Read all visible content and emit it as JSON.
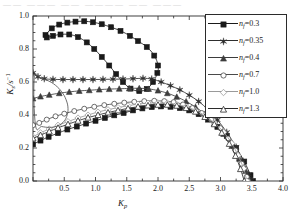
{
  "topstrip": "——  ———  ——  ————  ——  ———",
  "axes": {
    "ylabel_main": "K",
    "ylabel_sub": "s",
    "ylabel_unit": "/s",
    "ylabel_sup": "−1",
    "xlabel_main": "K",
    "xlabel_sub": "p",
    "xticks": [
      "0.5",
      "1.0",
      "1.5",
      "2.0",
      "2.5",
      "3.0",
      "3.5",
      "4.0"
    ],
    "yticks": [
      "0.0",
      "0.2",
      "0.4",
      "0.6",
      "0.8",
      "1.0"
    ]
  },
  "legend": {
    "entries": [
      {
        "label_prefix": "n",
        "label_sub": "f",
        "label_eq": "=0.3",
        "marker": "filled-square",
        "color": "#1a1a1a"
      },
      {
        "label_prefix": "n",
        "label_sub": "f",
        "label_eq": "=0.35",
        "marker": "filled-star",
        "color": "#2e2e2e"
      },
      {
        "label_prefix": "n",
        "label_sub": "f",
        "label_eq": "=0.4",
        "marker": "filled-triangle",
        "color": "#3d3d3d"
      },
      {
        "label_prefix": "n",
        "label_sub": "f",
        "label_eq": "=0.7",
        "marker": "open-circle",
        "color": "#4a4a4a"
      },
      {
        "label_prefix": "n",
        "label_sub": "f",
        "label_eq": "=1.0",
        "marker": "open-diamond",
        "color": "#9a9a9a"
      },
      {
        "label_prefix": "n",
        "label_sub": "f",
        "label_eq": "=1.3",
        "marker": "open-triangle",
        "color": "#2b2b2b"
      }
    ]
  },
  "chart_data": {
    "type": "line",
    "title": "",
    "xlabel": "Kp",
    "ylabel": "Ks / s^-1",
    "xlim": [
      0.0,
      4.0
    ],
    "ylim": [
      0.0,
      1.0
    ],
    "grid": false,
    "legend_position": "top-right",
    "series": [
      {
        "name": "nf=0.3",
        "marker": "filled-square",
        "color": "#1a1a1a",
        "closed_loop": true,
        "points": [
          [
            0.2,
            0.885
          ],
          [
            0.3,
            0.925
          ],
          [
            0.42,
            0.948
          ],
          [
            0.55,
            0.96
          ],
          [
            0.68,
            0.966
          ],
          [
            0.82,
            0.968
          ],
          [
            0.96,
            0.962
          ],
          [
            1.1,
            0.95
          ],
          [
            1.25,
            0.932
          ],
          [
            1.4,
            0.91
          ],
          [
            1.55,
            0.88
          ],
          [
            1.68,
            0.848
          ],
          [
            1.82,
            0.812
          ],
          [
            1.94,
            0.76
          ],
          [
            2.0,
            0.7
          ],
          [
            1.99,
            0.655
          ],
          [
            1.92,
            0.6
          ],
          [
            1.82,
            0.558
          ],
          [
            1.7,
            0.545
          ],
          [
            1.56,
            0.56
          ],
          [
            1.44,
            0.6
          ],
          [
            1.33,
            0.648
          ],
          [
            1.22,
            0.7
          ],
          [
            1.1,
            0.752
          ],
          [
            0.98,
            0.8
          ],
          [
            0.86,
            0.84
          ],
          [
            0.72,
            0.872
          ],
          [
            0.58,
            0.888
          ],
          [
            0.44,
            0.888
          ],
          [
            0.32,
            0.88
          ],
          [
            0.22,
            0.87
          ],
          [
            0.2,
            0.885
          ]
        ]
      },
      {
        "name": "nf=0.3-lower",
        "marker": "filled-square",
        "color": "#1a1a1a",
        "closed_loop": false,
        "points": [
          [
            0.0,
            0.222
          ],
          [
            0.12,
            0.245
          ],
          [
            0.25,
            0.268
          ],
          [
            0.4,
            0.29
          ],
          [
            0.55,
            0.312
          ],
          [
            0.7,
            0.33
          ],
          [
            0.85,
            0.348
          ],
          [
            1.0,
            0.365
          ],
          [
            1.15,
            0.382
          ],
          [
            1.3,
            0.398
          ],
          [
            1.45,
            0.412
          ],
          [
            1.6,
            0.428
          ],
          [
            1.75,
            0.44
          ],
          [
            1.9,
            0.448
          ],
          [
            2.05,
            0.452
          ],
          [
            2.2,
            0.45
          ],
          [
            2.35,
            0.442
          ],
          [
            2.5,
            0.428
          ],
          [
            2.65,
            0.405
          ],
          [
            2.8,
            0.372
          ],
          [
            2.95,
            0.328
          ],
          [
            3.1,
            0.272
          ],
          [
            3.25,
            0.2
          ],
          [
            3.38,
            0.118
          ],
          [
            3.48,
            0.035
          ],
          [
            3.52,
            0.0
          ]
        ]
      },
      {
        "name": "nf=0.35",
        "marker": "filled-star",
        "color": "#2e2e2e",
        "closed_loop": false,
        "points": [
          [
            0.0,
            0.655
          ],
          [
            0.08,
            0.632
          ],
          [
            0.18,
            0.62
          ],
          [
            0.32,
            0.616
          ],
          [
            0.48,
            0.615
          ],
          [
            0.64,
            0.615
          ],
          [
            0.8,
            0.615
          ],
          [
            0.96,
            0.615
          ],
          [
            1.12,
            0.616
          ],
          [
            1.28,
            0.617
          ],
          [
            1.44,
            0.618
          ],
          [
            1.6,
            0.62
          ],
          [
            1.76,
            0.622
          ],
          [
            1.9,
            0.618
          ],
          [
            2.05,
            0.6
          ],
          [
            2.2,
            0.578
          ],
          [
            2.35,
            0.552
          ],
          [
            2.5,
            0.52
          ],
          [
            2.65,
            0.482
          ],
          [
            2.8,
            0.432
          ],
          [
            2.95,
            0.37
          ],
          [
            3.1,
            0.295
          ],
          [
            3.25,
            0.205
          ],
          [
            3.36,
            0.12
          ],
          [
            3.45,
            0.04
          ],
          [
            3.49,
            0.0
          ]
        ]
      },
      {
        "name": "nf=0.4",
        "marker": "filled-triangle",
        "color": "#3d3d3d",
        "closed_loop": false,
        "points": [
          [
            0.0,
            0.5
          ],
          [
            0.12,
            0.512
          ],
          [
            0.26,
            0.522
          ],
          [
            0.42,
            0.532
          ],
          [
            0.58,
            0.54
          ],
          [
            0.74,
            0.546
          ],
          [
            0.9,
            0.55
          ],
          [
            1.06,
            0.554
          ],
          [
            1.22,
            0.557
          ],
          [
            1.38,
            0.559
          ],
          [
            1.54,
            0.561
          ],
          [
            1.7,
            0.562
          ],
          [
            1.85,
            0.558
          ],
          [
            2.0,
            0.548
          ],
          [
            2.15,
            0.532
          ],
          [
            2.3,
            0.51
          ],
          [
            2.45,
            0.482
          ],
          [
            2.6,
            0.448
          ],
          [
            2.75,
            0.405
          ],
          [
            2.9,
            0.35
          ],
          [
            3.05,
            0.285
          ],
          [
            3.18,
            0.212
          ],
          [
            3.3,
            0.135
          ],
          [
            3.4,
            0.06
          ],
          [
            3.46,
            0.0
          ]
        ]
      },
      {
        "name": "nf=0.7",
        "marker": "open-circle",
        "color": "#4a4a4a",
        "closed_loop": false,
        "points": [
          [
            0.0,
            0.338
          ],
          [
            0.1,
            0.352
          ],
          [
            0.22,
            0.372
          ],
          [
            0.36,
            0.392
          ],
          [
            0.5,
            0.408
          ],
          [
            0.66,
            0.424
          ],
          [
            0.82,
            0.438
          ],
          [
            0.98,
            0.45
          ],
          [
            1.14,
            0.46
          ],
          [
            1.3,
            0.468
          ],
          [
            1.46,
            0.475
          ],
          [
            1.62,
            0.48
          ],
          [
            1.78,
            0.484
          ],
          [
            1.94,
            0.486
          ],
          [
            2.1,
            0.484
          ],
          [
            2.25,
            0.478
          ],
          [
            2.4,
            0.464
          ],
          [
            2.55,
            0.442
          ],
          [
            2.7,
            0.412
          ],
          [
            2.85,
            0.372
          ],
          [
            3.0,
            0.32
          ],
          [
            3.12,
            0.258
          ],
          [
            3.24,
            0.185
          ],
          [
            3.34,
            0.105
          ],
          [
            3.42,
            0.025
          ],
          [
            3.44,
            0.0
          ]
        ]
      },
      {
        "name": "nf=1.0",
        "marker": "open-diamond",
        "color": "#9a9a9a",
        "closed_loop": false,
        "points": [
          [
            0.0,
            0.268
          ],
          [
            0.12,
            0.292
          ],
          [
            0.26,
            0.315
          ],
          [
            0.4,
            0.338
          ],
          [
            0.56,
            0.36
          ],
          [
            0.72,
            0.382
          ],
          [
            0.88,
            0.4
          ],
          [
            1.04,
            0.418
          ],
          [
            1.2,
            0.432
          ],
          [
            1.36,
            0.445
          ],
          [
            1.52,
            0.456
          ],
          [
            1.68,
            0.466
          ],
          [
            1.84,
            0.472
          ],
          [
            2.0,
            0.474
          ],
          [
            2.15,
            0.472
          ],
          [
            2.3,
            0.464
          ],
          [
            2.45,
            0.45
          ],
          [
            2.6,
            0.428
          ],
          [
            2.75,
            0.396
          ],
          [
            2.9,
            0.352
          ],
          [
            3.05,
            0.296
          ],
          [
            3.18,
            0.228
          ],
          [
            3.28,
            0.155
          ],
          [
            3.37,
            0.075
          ],
          [
            3.42,
            0.0
          ]
        ]
      },
      {
        "name": "nf=1.3",
        "marker": "open-triangle",
        "color": "#2b2b2b",
        "closed_loop": false,
        "points": [
          [
            0.0,
            0.258
          ],
          [
            0.12,
            0.278
          ],
          [
            0.26,
            0.3
          ],
          [
            0.4,
            0.322
          ],
          [
            0.56,
            0.344
          ],
          [
            0.72,
            0.365
          ],
          [
            0.88,
            0.384
          ],
          [
            1.04,
            0.4
          ],
          [
            1.2,
            0.415
          ],
          [
            1.36,
            0.428
          ],
          [
            1.52,
            0.44
          ],
          [
            1.68,
            0.45
          ],
          [
            1.84,
            0.458
          ],
          [
            2.0,
            0.462
          ],
          [
            2.15,
            0.462
          ],
          [
            2.3,
            0.456
          ],
          [
            2.45,
            0.442
          ],
          [
            2.6,
            0.42
          ],
          [
            2.75,
            0.388
          ],
          [
            2.9,
            0.344
          ],
          [
            3.02,
            0.292
          ],
          [
            3.14,
            0.225
          ],
          [
            3.24,
            0.152
          ],
          [
            3.32,
            0.072
          ],
          [
            3.38,
            0.0
          ]
        ]
      },
      {
        "name": "small-loop",
        "marker": "none",
        "color": "#555555",
        "closed_loop": true,
        "points": [
          [
            0.02,
            0.625
          ],
          [
            0.12,
            0.622
          ],
          [
            0.24,
            0.608
          ],
          [
            0.36,
            0.58
          ],
          [
            0.46,
            0.54
          ],
          [
            0.53,
            0.492
          ],
          [
            0.56,
            0.44
          ],
          [
            0.54,
            0.392
          ],
          [
            0.48,
            0.355
          ],
          [
            0.38,
            0.332
          ],
          [
            0.26,
            0.325
          ],
          [
            0.14,
            0.33
          ],
          [
            0.04,
            0.338
          ]
        ]
      }
    ]
  }
}
